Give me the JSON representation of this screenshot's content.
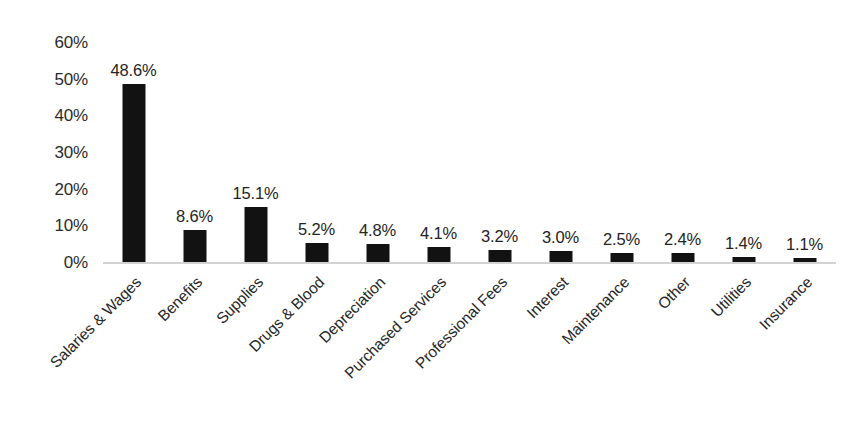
{
  "chart_data": {
    "type": "bar",
    "title": "",
    "subtitle": "",
    "xlabel": "",
    "ylabel": "",
    "ylim": [
      0,
      60
    ],
    "ytick_labels": [
      "60%",
      "50%",
      "40%",
      "30%",
      "20%",
      "10%",
      "0%"
    ],
    "yticks": [
      60,
      50,
      40,
      30,
      20,
      10,
      0
    ],
    "grid": false,
    "legend": null,
    "bar_color": "#121212",
    "axis_color": "#d2d2d2",
    "text_color": "#262626",
    "categories": [
      "Salaries & Wages",
      "Benefits",
      "Supplies",
      "Drugs & Blood",
      "Depreciation",
      "Purchased Services",
      "Professional Fees",
      "Interest",
      "Maintenance",
      "Other",
      "Utilities",
      "Insurance"
    ],
    "values": [
      48.6,
      8.6,
      15.1,
      5.2,
      4.8,
      4.1,
      3.2,
      3.0,
      2.5,
      2.4,
      1.4,
      1.1
    ],
    "data_labels": [
      "48.6%",
      "8.6%",
      "15.1%",
      "5.2%",
      "4.8%",
      "4.1%",
      "3.2%",
      "3.0%",
      "2.5%",
      "2.4%",
      "1.4%",
      "1.1%"
    ]
  }
}
